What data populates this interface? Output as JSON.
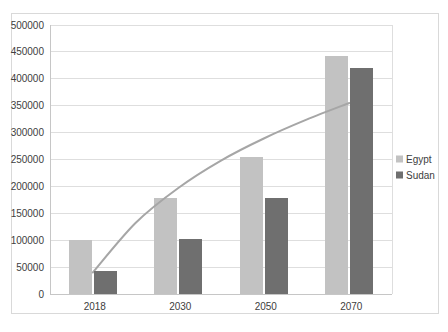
{
  "window": {
    "background": "#ffffff",
    "chart_border_color": "#d9d9d9"
  },
  "chart_data": {
    "type": "bar",
    "categories": [
      "2018",
      "2030",
      "2050",
      "2070"
    ],
    "series": [
      {
        "name": "Egypt",
        "color": "#c2c2c2",
        "values": [
          100000,
          178000,
          255000,
          443000
        ]
      },
      {
        "name": "Sudan",
        "color": "#6f6f6f",
        "values": [
          42000,
          102000,
          178000,
          420000
        ]
      }
    ],
    "trendline": {
      "color": "#a6a6a6",
      "width": 2,
      "points": [
        [
          0,
          40000
        ],
        [
          0.5,
          132000
        ],
        [
          1,
          197000
        ],
        [
          1.5,
          248000
        ],
        [
          2,
          289000
        ],
        [
          2.5,
          324000
        ],
        [
          3,
          355000
        ]
      ]
    },
    "ylim": [
      0,
      500000
    ],
    "ytick_step": 50000,
    "ytick_labels": [
      "0",
      "50000",
      "100000",
      "150000",
      "200000",
      "250000",
      "300000",
      "350000",
      "400000",
      "450000",
      "500000"
    ],
    "grid": true,
    "legend": {
      "position": "right",
      "entries": [
        "Egypt",
        "Sudan"
      ]
    },
    "axis_color": "#c6c6c6",
    "gridline_color": "#dedede",
    "label_color": "#404040"
  }
}
